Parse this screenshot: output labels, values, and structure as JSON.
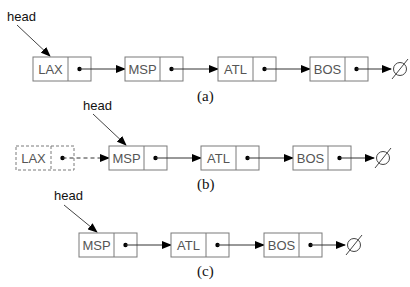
{
  "diagram": {
    "panels": [
      {
        "caption": "(a)",
        "head_label": "head",
        "head_points_to": "LAX",
        "nodes": [
          {
            "label": "LAX",
            "removed": false
          },
          {
            "label": "MSP",
            "removed": false
          },
          {
            "label": "ATL",
            "removed": false
          },
          {
            "label": "BOS",
            "removed": false
          }
        ],
        "terminator": "null-icon"
      },
      {
        "caption": "(b)",
        "head_label": "head",
        "head_points_to": "MSP",
        "nodes": [
          {
            "label": "LAX",
            "removed": true
          },
          {
            "label": "MSP",
            "removed": false
          },
          {
            "label": "ATL",
            "removed": false
          },
          {
            "label": "BOS",
            "removed": false
          }
        ],
        "terminator": "null-icon"
      },
      {
        "caption": "(c)",
        "head_label": "head",
        "head_points_to": "MSP",
        "nodes": [
          {
            "label": "MSP",
            "removed": false
          },
          {
            "label": "ATL",
            "removed": false
          },
          {
            "label": "BOS",
            "removed": false
          }
        ],
        "terminator": "null-icon"
      }
    ]
  }
}
